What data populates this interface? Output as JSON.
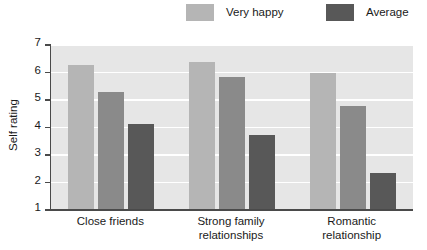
{
  "chart_data": {
    "type": "bar",
    "title": "",
    "xlabel": "",
    "ylabel": "Self rating",
    "ylim": [
      1,
      7
    ],
    "yticks": [
      1,
      2,
      3,
      4,
      5,
      6,
      7
    ],
    "grid": true,
    "legend_position": "top-right",
    "categories": [
      "Close friends",
      "Strong family relationships",
      "Romantic relationship"
    ],
    "category_lines": [
      [
        "Close friends"
      ],
      [
        "Strong family",
        "relationships"
      ],
      [
        "Romantic",
        "relationship"
      ]
    ],
    "series": [
      {
        "name": "Very happy",
        "color": "#b5b5b5",
        "in_legend": true,
        "values": [
          6.25,
          6.35,
          5.95
        ]
      },
      {
        "name": "Average",
        "color": "#8a8a8a",
        "in_legend": false,
        "values": [
          5.25,
          5.8,
          4.75
        ]
      },
      {
        "name": "Unhappy",
        "color": "#585858",
        "in_legend": true,
        "legend_name": "Average",
        "values": [
          4.1,
          3.7,
          2.3
        ]
      }
    ]
  },
  "legend": {
    "entries": [
      {
        "label": "Very happy",
        "color": "#b5b5b5"
      },
      {
        "label": "Average",
        "color": "#585858"
      }
    ]
  },
  "axis": {
    "y_title": "Self rating",
    "y_tick_labels": [
      "7",
      "6",
      "5",
      "4",
      "3",
      "2",
      "1"
    ]
  },
  "colors": {
    "plot_background": "#e6e6e6",
    "gridline": "#ffffff",
    "axis_line": "#4a4a4a",
    "text": "#1a1a1a",
    "bar_light": "#b5b5b5",
    "bar_medium": "#8a8a8a",
    "bar_dark": "#585858"
  }
}
